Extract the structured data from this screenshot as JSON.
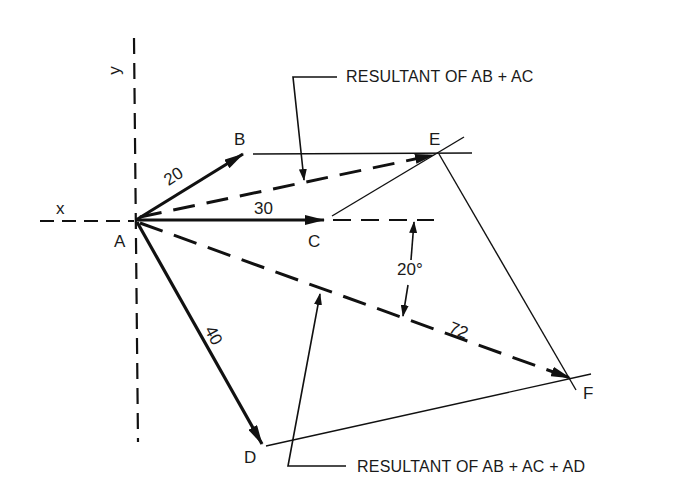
{
  "diagram": {
    "type": "vector addition diagram",
    "axes": {
      "x_label": "x",
      "y_label": "y"
    },
    "points": {
      "A": "A",
      "B": "B",
      "C": "C",
      "D": "D",
      "E": "E",
      "F": "F"
    },
    "vectors": [
      {
        "from": "A",
        "to": "B",
        "magnitude": "20"
      },
      {
        "from": "A",
        "to": "C",
        "magnitude": "30"
      },
      {
        "from": "A",
        "to": "D",
        "magnitude": "40"
      },
      {
        "from": "A",
        "to": "E",
        "magnitude": "",
        "style": "dashed"
      },
      {
        "from": "A",
        "to": "F",
        "magnitude": "72",
        "style": "dashed"
      }
    ],
    "angle_label": "20°",
    "annotations": {
      "resultant_ab_ac": "RESULTANT OF AB + AC",
      "resultant_ab_ac_ad": "RESULTANT OF AB + AC + AD"
    }
  }
}
